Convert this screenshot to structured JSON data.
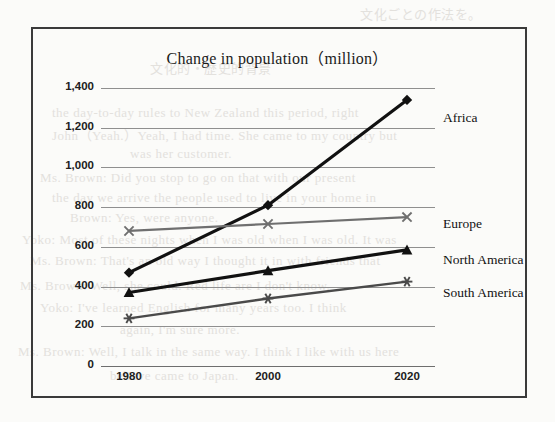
{
  "figure": {
    "title": "Change in population（million）",
    "border_color": "#3a3a3a",
    "background_color": "#fbfbf9"
  },
  "bleed_text": [
    {
      "text": "文化ごとの作法を。",
      "x": 360,
      "y": 4
    },
    {
      "text": "文化的・歴史的背景",
      "x": 150,
      "y": 58
    },
    {
      "text": "the day-to-day rules to New Zealand this period, right",
      "x": 52,
      "y": 105
    },
    {
      "text": "John（Yeah.）Yeah, I had time. She came to my country but",
      "x": 52,
      "y": 125
    },
    {
      "text": "was her customer.",
      "x": 130,
      "y": 146
    },
    {
      "text": "Ms. Brown: Did you stop to go on that with our present",
      "x": 40,
      "y": 170
    },
    {
      "text": "the day we arrive the people used to live in your home in",
      "x": 52,
      "y": 190
    },
    {
      "text": "Brown: Yes, were anyone.",
      "x": 70,
      "y": 210
    },
    {
      "text": "Yoko: Most of these nights when I was old when I was old. It was",
      "x": 22,
      "y": 232
    },
    {
      "text": "Ms. Brown: That's an old way I thought it in with friends that",
      "x": 30,
      "y": 253
    },
    {
      "text": "Ms. Brown: Well, she could. Red life are I don't know.",
      "x": 20,
      "y": 278
    },
    {
      "text": "Yoko: I've learned English for many years too. I think",
      "x": 40,
      "y": 300
    },
    {
      "text": "again, I'm sure more.",
      "x": 120,
      "y": 322
    },
    {
      "text": "Ms. Brown: Well, I talk in the same way. I think I like with us here",
      "x": 18,
      "y": 344
    },
    {
      "text": "believe came to Japan.",
      "x": 110,
      "y": 368
    }
  ],
  "chart_data": {
    "type": "line",
    "title": "Change in population（million）",
    "xlabel": "",
    "ylabel": "",
    "x": [
      "1980",
      "2000",
      "2020"
    ],
    "categories": [
      "1980",
      "2000",
      "2020"
    ],
    "ylim": [
      0,
      1400
    ],
    "yticks": [
      0,
      200,
      400,
      600,
      800,
      1000,
      1200,
      1400
    ],
    "ytick_labels": [
      "0",
      "200",
      "400",
      "600",
      "800",
      "1,000",
      "1,200",
      "1,400"
    ],
    "grid": true,
    "legend_position": "right-inline",
    "series": [
      {
        "name": "Africa",
        "values": [
          470,
          810,
          1340
        ],
        "marker": "diamond",
        "color": "#111111",
        "line_width": 3.2,
        "label_y": 110
      },
      {
        "name": "Europe",
        "values": [
          680,
          715,
          750
        ],
        "marker": "x",
        "color": "#6f6f6f",
        "line_width": 2.2,
        "label_y": 216
      },
      {
        "name": "North America",
        "values": [
          370,
          480,
          585
        ],
        "marker": "triangle",
        "color": "#111111",
        "line_width": 3.2,
        "label_y": 252
      },
      {
        "name": "South America",
        "values": [
          240,
          340,
          425
        ],
        "marker": "asterisk",
        "color": "#4a4a4a",
        "line_width": 2.4,
        "label_y": 285
      }
    ]
  }
}
